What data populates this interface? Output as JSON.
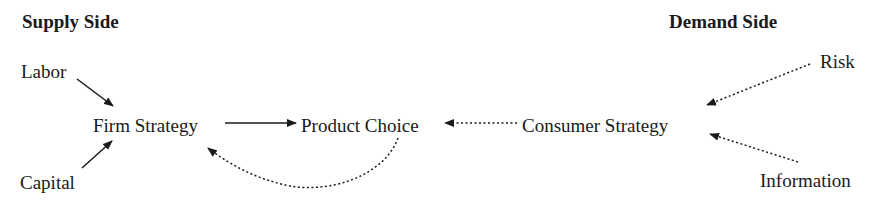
{
  "supply": {
    "header": "Supply Side",
    "labor": "Labor",
    "capital": "Capital",
    "firm_strategy": "Firm Strategy"
  },
  "center": {
    "product_choice": "Product Choice"
  },
  "demand": {
    "header": "Demand Side",
    "risk": "Risk",
    "information": "Information",
    "consumer_strategy": "Consumer Strategy"
  },
  "edges": [
    {
      "from": "Labor",
      "to": "Firm Strategy",
      "style": "solid"
    },
    {
      "from": "Capital",
      "to": "Firm Strategy",
      "style": "solid"
    },
    {
      "from": "Firm Strategy",
      "to": "Product Choice",
      "style": "solid"
    },
    {
      "from": "Consumer Strategy",
      "to": "Product Choice",
      "style": "dotted"
    },
    {
      "from": "Product Choice",
      "to": "Firm Strategy",
      "style": "dotted-curved"
    },
    {
      "from": "Risk",
      "to": "Consumer Strategy",
      "style": "dotted"
    },
    {
      "from": "Information",
      "to": "Consumer Strategy",
      "style": "dotted"
    }
  ]
}
